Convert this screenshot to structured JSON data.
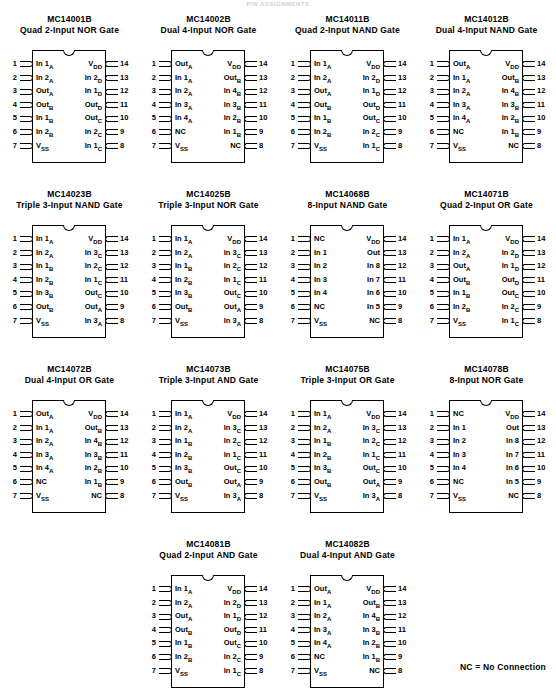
{
  "page": {
    "header": "PIN ASSIGNMENTS",
    "footnote": "NC = No Connection"
  },
  "chips": [
    {
      "part": "MC14001B",
      "desc": "Quad 2-Input NOR Gate",
      "left": [
        {
          "n": "1",
          "label": "In 1A"
        },
        {
          "n": "2",
          "label": "In 2A"
        },
        {
          "n": "3",
          "label": "OutA"
        },
        {
          "n": "4",
          "label": "OutB"
        },
        {
          "n": "5",
          "label": "In 1B"
        },
        {
          "n": "6",
          "label": "In 2B"
        },
        {
          "n": "7",
          "label": "VSS"
        }
      ],
      "right": [
        {
          "n": "14",
          "label": "VDD"
        },
        {
          "n": "13",
          "label": "In 2D"
        },
        {
          "n": "12",
          "label": "In 1D"
        },
        {
          "n": "11",
          "label": "OutD"
        },
        {
          "n": "10",
          "label": "OutC"
        },
        {
          "n": "9",
          "label": "In 2C"
        },
        {
          "n": "8",
          "label": "In 1C"
        }
      ]
    },
    {
      "part": "MC14002B",
      "desc": "Dual 4-Input NOR Gate",
      "left": [
        {
          "n": "1",
          "label": "OutA"
        },
        {
          "n": "2",
          "label": "In 1A"
        },
        {
          "n": "3",
          "label": "In 2A"
        },
        {
          "n": "4",
          "label": "In 3A"
        },
        {
          "n": "5",
          "label": "In 4A"
        },
        {
          "n": "6",
          "label": "NC"
        },
        {
          "n": "7",
          "label": "VSS"
        }
      ],
      "right": [
        {
          "n": "14",
          "label": "VDD"
        },
        {
          "n": "13",
          "label": "OutB"
        },
        {
          "n": "12",
          "label": "In 4B"
        },
        {
          "n": "11",
          "label": "In 3B"
        },
        {
          "n": "10",
          "label": "In 2B"
        },
        {
          "n": "9",
          "label": "In 1B"
        },
        {
          "n": "8",
          "label": "NC"
        }
      ]
    },
    {
      "part": "MC14011B",
      "desc": "Quad 2-Input NAND Gate",
      "left": [
        {
          "n": "1",
          "label": "In 1A"
        },
        {
          "n": "2",
          "label": "In 2A"
        },
        {
          "n": "3",
          "label": "OutA"
        },
        {
          "n": "4",
          "label": "OutB"
        },
        {
          "n": "5",
          "label": "In 1B"
        },
        {
          "n": "6",
          "label": "In 2B"
        },
        {
          "n": "7",
          "label": "VSS"
        }
      ],
      "right": [
        {
          "n": "14",
          "label": "VDD"
        },
        {
          "n": "13",
          "label": "In 2D"
        },
        {
          "n": "12",
          "label": "In 1D"
        },
        {
          "n": "11",
          "label": "OutD"
        },
        {
          "n": "10",
          "label": "OutC"
        },
        {
          "n": "9",
          "label": "In 2C"
        },
        {
          "n": "8",
          "label": "In 1C"
        }
      ]
    },
    {
      "part": "MC14012B",
      "desc": "Dual 4-Input NAND Gate",
      "left": [
        {
          "n": "1",
          "label": "OutA"
        },
        {
          "n": "2",
          "label": "In 1A"
        },
        {
          "n": "3",
          "label": "In 2A"
        },
        {
          "n": "4",
          "label": "In 3A"
        },
        {
          "n": "5",
          "label": "In 4A"
        },
        {
          "n": "6",
          "label": "NC"
        },
        {
          "n": "7",
          "label": "VSS"
        }
      ],
      "right": [
        {
          "n": "14",
          "label": "VDD"
        },
        {
          "n": "13",
          "label": "OutB"
        },
        {
          "n": "12",
          "label": "In 4B"
        },
        {
          "n": "11",
          "label": "In 3B"
        },
        {
          "n": "10",
          "label": "In 2B"
        },
        {
          "n": "9",
          "label": "In 1B"
        },
        {
          "n": "8",
          "label": "NC"
        }
      ]
    },
    {
      "part": "MC14023B",
      "desc": "Triple 3-Input NAND Gate",
      "left": [
        {
          "n": "1",
          "label": "In 1A"
        },
        {
          "n": "2",
          "label": "In 2A"
        },
        {
          "n": "3",
          "label": "In 1B"
        },
        {
          "n": "4",
          "label": "In 2B"
        },
        {
          "n": "5",
          "label": "In 3B"
        },
        {
          "n": "6",
          "label": "OutB"
        },
        {
          "n": "7",
          "label": "VSS"
        }
      ],
      "right": [
        {
          "n": "14",
          "label": "VDD"
        },
        {
          "n": "13",
          "label": "In 3C"
        },
        {
          "n": "12",
          "label": "In 2C"
        },
        {
          "n": "11",
          "label": "In 1C"
        },
        {
          "n": "10",
          "label": "OutC"
        },
        {
          "n": "9",
          "label": "OutA"
        },
        {
          "n": "8",
          "label": "In 3A"
        }
      ]
    },
    {
      "part": "MC14025B",
      "desc": "Triple 3-Input NOR Gate",
      "left": [
        {
          "n": "1",
          "label": "In 1A"
        },
        {
          "n": "2",
          "label": "In 2A"
        },
        {
          "n": "3",
          "label": "In 1B"
        },
        {
          "n": "4",
          "label": "In 2B"
        },
        {
          "n": "5",
          "label": "In 3B"
        },
        {
          "n": "6",
          "label": "OutB"
        },
        {
          "n": "7",
          "label": "VSS"
        }
      ],
      "right": [
        {
          "n": "14",
          "label": "VDD"
        },
        {
          "n": "13",
          "label": "In 3C"
        },
        {
          "n": "12",
          "label": "In 2C"
        },
        {
          "n": "11",
          "label": "In 1C"
        },
        {
          "n": "10",
          "label": "OutC"
        },
        {
          "n": "9",
          "label": "OutA"
        },
        {
          "n": "8",
          "label": "In 3A"
        }
      ]
    },
    {
      "part": "MC14068B",
      "desc": "8-Input NAND Gate",
      "left": [
        {
          "n": "1",
          "label": "NC"
        },
        {
          "n": "2",
          "label": "In 1"
        },
        {
          "n": "3",
          "label": "In 2"
        },
        {
          "n": "4",
          "label": "In 3"
        },
        {
          "n": "5",
          "label": "In 4"
        },
        {
          "n": "6",
          "label": "NC"
        },
        {
          "n": "7",
          "label": "VSS"
        }
      ],
      "right": [
        {
          "n": "14",
          "label": "VDD"
        },
        {
          "n": "13",
          "label": "Out"
        },
        {
          "n": "12",
          "label": "In 8"
        },
        {
          "n": "11",
          "label": "In 7"
        },
        {
          "n": "10",
          "label": "In 6"
        },
        {
          "n": "9",
          "label": "In 5"
        },
        {
          "n": "8",
          "label": "NC"
        }
      ]
    },
    {
      "part": "MC14071B",
      "desc": "Quad 2-Input OR Gate",
      "left": [
        {
          "n": "1",
          "label": "In 1A"
        },
        {
          "n": "2",
          "label": "In 2A"
        },
        {
          "n": "3",
          "label": "OutA"
        },
        {
          "n": "4",
          "label": "OutB"
        },
        {
          "n": "5",
          "label": "In 1B"
        },
        {
          "n": "6",
          "label": "In 2B"
        },
        {
          "n": "7",
          "label": "VSS"
        }
      ],
      "right": [
        {
          "n": "14",
          "label": "VDD"
        },
        {
          "n": "13",
          "label": "In 2D"
        },
        {
          "n": "12",
          "label": "In 1D"
        },
        {
          "n": "11",
          "label": "OutD"
        },
        {
          "n": "10",
          "label": "OutC"
        },
        {
          "n": "9",
          "label": "In 2C"
        },
        {
          "n": "8",
          "label": "In 1C"
        }
      ]
    },
    {
      "part": "MC14072B",
      "desc": "Dual 4-Input OR Gate",
      "left": [
        {
          "n": "1",
          "label": "OutA"
        },
        {
          "n": "2",
          "label": "In 1A"
        },
        {
          "n": "3",
          "label": "In 2A"
        },
        {
          "n": "4",
          "label": "In 3A"
        },
        {
          "n": "5",
          "label": "In 4A"
        },
        {
          "n": "6",
          "label": "NC"
        },
        {
          "n": "7",
          "label": "VSS"
        }
      ],
      "right": [
        {
          "n": "14",
          "label": "VDD"
        },
        {
          "n": "13",
          "label": "OutB"
        },
        {
          "n": "12",
          "label": "In 4B"
        },
        {
          "n": "11",
          "label": "In 3B"
        },
        {
          "n": "10",
          "label": "In 2B"
        },
        {
          "n": "9",
          "label": "In 1B"
        },
        {
          "n": "8",
          "label": "NC"
        }
      ]
    },
    {
      "part": "MC14073B",
      "desc": "Triple 3-Input AND Gate",
      "left": [
        {
          "n": "1",
          "label": "In 1A"
        },
        {
          "n": "2",
          "label": "In 2A"
        },
        {
          "n": "3",
          "label": "In 1B"
        },
        {
          "n": "4",
          "label": "In 2B"
        },
        {
          "n": "5",
          "label": "In 3B"
        },
        {
          "n": "6",
          "label": "OutB"
        },
        {
          "n": "7",
          "label": "VSS"
        }
      ],
      "right": [
        {
          "n": "14",
          "label": "VDD"
        },
        {
          "n": "13",
          "label": "In 3C"
        },
        {
          "n": "12",
          "label": "In 2C"
        },
        {
          "n": "11",
          "label": "In 1C"
        },
        {
          "n": "10",
          "label": "OutC"
        },
        {
          "n": "9",
          "label": "OutA"
        },
        {
          "n": "8",
          "label": "In 3A"
        }
      ]
    },
    {
      "part": "MC14075B",
      "desc": "Triple 3-Input OR Gate",
      "left": [
        {
          "n": "1",
          "label": "In 1A"
        },
        {
          "n": "2",
          "label": "In 2A"
        },
        {
          "n": "3",
          "label": "In 1B"
        },
        {
          "n": "4",
          "label": "In 2B"
        },
        {
          "n": "5",
          "label": "In 3B"
        },
        {
          "n": "6",
          "label": "OutB"
        },
        {
          "n": "7",
          "label": "VSS"
        }
      ],
      "right": [
        {
          "n": "14",
          "label": "VDD"
        },
        {
          "n": "13",
          "label": "In 3C"
        },
        {
          "n": "12",
          "label": "In 2C"
        },
        {
          "n": "11",
          "label": "In 1C"
        },
        {
          "n": "10",
          "label": "OutC"
        },
        {
          "n": "9",
          "label": "OutA"
        },
        {
          "n": "8",
          "label": "In 3A"
        }
      ]
    },
    {
      "part": "MC14078B",
      "desc": "8-Input NOR Gate",
      "left": [
        {
          "n": "1",
          "label": "NC"
        },
        {
          "n": "2",
          "label": "In 1"
        },
        {
          "n": "3",
          "label": "In 2"
        },
        {
          "n": "4",
          "label": "In 3"
        },
        {
          "n": "5",
          "label": "In 4"
        },
        {
          "n": "6",
          "label": "NC"
        },
        {
          "n": "7",
          "label": "VSS"
        }
      ],
      "right": [
        {
          "n": "14",
          "label": "VDD"
        },
        {
          "n": "13",
          "label": "Out"
        },
        {
          "n": "12",
          "label": "In 8"
        },
        {
          "n": "11",
          "label": "In 7"
        },
        {
          "n": "10",
          "label": "In 6"
        },
        {
          "n": "9",
          "label": "In 5"
        },
        {
          "n": "8",
          "label": "NC"
        }
      ]
    },
    {
      "part": "MC14081B",
      "desc": "Quad 2-Input AND Gate",
      "left": [
        {
          "n": "1",
          "label": "In 1A"
        },
        {
          "n": "2",
          "label": "In 2A"
        },
        {
          "n": "3",
          "label": "OutA"
        },
        {
          "n": "4",
          "label": "OutB"
        },
        {
          "n": "5",
          "label": "In 1B"
        },
        {
          "n": "6",
          "label": "In 2B"
        },
        {
          "n": "7",
          "label": "VSS"
        }
      ],
      "right": [
        {
          "n": "14",
          "label": "VDD"
        },
        {
          "n": "13",
          "label": "In 2D"
        },
        {
          "n": "12",
          "label": "In 1D"
        },
        {
          "n": "11",
          "label": "OutD"
        },
        {
          "n": "10",
          "label": "OutC"
        },
        {
          "n": "9",
          "label": "In 2C"
        },
        {
          "n": "8",
          "label": "In 1C"
        }
      ]
    },
    {
      "part": "MC14082B",
      "desc": "Dual 4-Input AND Gate",
      "left": [
        {
          "n": "1",
          "label": "OutA"
        },
        {
          "n": "2",
          "label": "In 1A"
        },
        {
          "n": "3",
          "label": "In 2A"
        },
        {
          "n": "4",
          "label": "In 3A"
        },
        {
          "n": "5",
          "label": "In 4A"
        },
        {
          "n": "6",
          "label": "NC"
        },
        {
          "n": "7",
          "label": "VSS"
        }
      ],
      "right": [
        {
          "n": "14",
          "label": "VDD"
        },
        {
          "n": "13",
          "label": "OutB"
        },
        {
          "n": "12",
          "label": "In 4B"
        },
        {
          "n": "11",
          "label": "In 3B"
        },
        {
          "n": "10",
          "label": "In 2B"
        },
        {
          "n": "9",
          "label": "In 1B"
        },
        {
          "n": "8",
          "label": "NC"
        }
      ]
    }
  ],
  "layout": {
    "rows": [
      {
        "cols": [
          0,
          1,
          2,
          3
        ]
      },
      {
        "cols": [
          4,
          5,
          6,
          7
        ]
      },
      {
        "cols": [
          8,
          9,
          10,
          11
        ]
      },
      {
        "cols": [
          null,
          12,
          13,
          null
        ]
      }
    ]
  }
}
